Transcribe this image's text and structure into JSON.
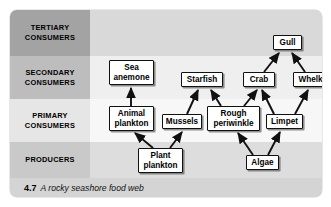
{
  "figure": {
    "caption_number": "4.7",
    "caption_text": "A rocky seashore food web"
  },
  "trophic_levels": [
    {
      "id": "tertiary",
      "label": "TERTIARY\nCONSUMERS",
      "label_line1": "TERTIARY",
      "label_line2": "CONSUMERS",
      "band_color": "#d9d9d9",
      "cell_color": "#a3a3a3"
    },
    {
      "id": "secondary",
      "label": "SECONDARY\nCONSUMERS",
      "label_line1": "SECONDARY",
      "label_line2": "CONSUMERS",
      "band_color": "#efefef",
      "cell_color": "#bdbdbd"
    },
    {
      "id": "primary",
      "label": "PRIMARY\nCONSUMERS",
      "label_line1": "PRIMARY",
      "label_line2": "CONSUMERS",
      "band_color": "#f7f7f7",
      "cell_color": "#e6e6e6"
    },
    {
      "id": "producers",
      "label": "PRODUCERS",
      "label_line1": "PRODUCERS",
      "label_line2": "",
      "band_color": "#dddddd",
      "cell_color": "#c9c9c9"
    }
  ],
  "nodes": [
    {
      "id": "gull",
      "label": "Gull",
      "line1": "Gull",
      "line2": "",
      "level": "tertiary",
      "x": 263,
      "y": 25,
      "w": 29,
      "h": 15
    },
    {
      "id": "sea-anemone",
      "label": "Sea anemone",
      "line1": "Sea",
      "line2": "anemone",
      "level": "secondary",
      "x": 99,
      "y": 50,
      "w": 45,
      "h": 25
    },
    {
      "id": "starfish",
      "label": "Starfish",
      "line1": "Starfish",
      "line2": "",
      "level": "secondary",
      "x": 171,
      "y": 62,
      "w": 42,
      "h": 15
    },
    {
      "id": "crab",
      "label": "Crab",
      "line1": "Crab",
      "line2": "",
      "level": "secondary",
      "x": 233,
      "y": 62,
      "w": 32,
      "h": 15
    },
    {
      "id": "whelk",
      "label": "Whelk",
      "line1": "Whelk",
      "line2": "",
      "level": "secondary",
      "x": 283,
      "y": 62,
      "w": 35,
      "h": 15
    },
    {
      "id": "animal-plankton",
      "label": "Animal plankton",
      "line1": "Animal",
      "line2": "plankton",
      "level": "primary",
      "x": 99,
      "y": 96,
      "w": 45,
      "h": 25
    },
    {
      "id": "mussels",
      "label": "Mussels",
      "line1": "Mussels",
      "line2": "",
      "level": "primary",
      "x": 152,
      "y": 104,
      "w": 40,
      "h": 15
    },
    {
      "id": "rough-periwinkle",
      "label": "Rough periwinkle",
      "line1": "Rough",
      "line2": "periwinkle",
      "level": "primary",
      "x": 197,
      "y": 96,
      "w": 53,
      "h": 25
    },
    {
      "id": "limpet",
      "label": "Limpet",
      "line1": "Limpet",
      "line2": "",
      "level": "primary",
      "x": 256,
      "y": 104,
      "w": 37,
      "h": 15
    },
    {
      "id": "plant-plankton",
      "label": "Plant plankton",
      "line1": "Plant",
      "line2": "plankton",
      "level": "producers",
      "x": 128,
      "y": 138,
      "w": 45,
      "h": 25
    },
    {
      "id": "algae",
      "label": "Algae",
      "line1": "Algae",
      "line2": "",
      "level": "producers",
      "x": 236,
      "y": 145,
      "w": 33,
      "h": 15
    }
  ],
  "edges": [
    {
      "from": "animal-plankton",
      "to": "sea-anemone",
      "x1": 121,
      "y1": 96,
      "x2": 121,
      "y2": 78
    },
    {
      "from": "plant-plankton",
      "to": "animal-plankton",
      "x1": 143,
      "y1": 138,
      "x2": 125,
      "y2": 123
    },
    {
      "from": "plant-plankton",
      "to": "mussels",
      "x1": 160,
      "y1": 138,
      "x2": 172,
      "y2": 122
    },
    {
      "from": "mussels",
      "to": "starfish",
      "x1": 177,
      "y1": 104,
      "x2": 188,
      "y2": 80
    },
    {
      "from": "rough-periwinkle",
      "to": "starfish",
      "x1": 211,
      "y1": 96,
      "x2": 201,
      "y2": 80
    },
    {
      "from": "rough-periwinkle",
      "to": "crab",
      "x1": 234,
      "y1": 96,
      "x2": 247,
      "y2": 80
    },
    {
      "from": "algae",
      "to": "rough-periwinkle",
      "x1": 243,
      "y1": 145,
      "x2": 228,
      "y2": 123
    },
    {
      "from": "algae",
      "to": "limpet",
      "x1": 258,
      "y1": 145,
      "x2": 270,
      "y2": 122
    },
    {
      "from": "limpet",
      "to": "crab",
      "x1": 264,
      "y1": 104,
      "x2": 252,
      "y2": 80
    },
    {
      "from": "limpet",
      "to": "whelk",
      "x1": 285,
      "y1": 104,
      "x2": 298,
      "y2": 80
    },
    {
      "from": "crab",
      "to": "gull",
      "x1": 254,
      "y1": 62,
      "x2": 269,
      "y2": 43
    },
    {
      "from": "whelk",
      "to": "gull",
      "x1": 295,
      "y1": 62,
      "x2": 282,
      "y2": 43
    }
  ],
  "colors": {
    "node_fill": "#ffffff",
    "node_border": "#111111",
    "arrow": "#111111",
    "card_bg": "#e3e3e3",
    "caption_bg": "#d4d4d4"
  }
}
